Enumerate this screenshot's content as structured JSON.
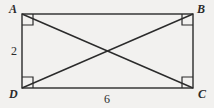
{
  "figure": {
    "kind": "rectangle-with-diagonals",
    "stroke_color": "#2b2b2b",
    "background_color": "#f2f1ef",
    "vertices": [
      {
        "id": "A",
        "label": "A",
        "position": "top-left",
        "x": 22,
        "y": 14,
        "right_angle": true
      },
      {
        "id": "B",
        "label": "B",
        "position": "top-right",
        "x": 193,
        "y": 14,
        "right_angle": true
      },
      {
        "id": "C",
        "label": "C",
        "position": "bottom-right",
        "x": 193,
        "y": 88,
        "right_angle": true
      },
      {
        "id": "D",
        "label": "D",
        "position": "bottom-left",
        "x": 22,
        "y": 88,
        "right_angle": true
      }
    ],
    "sides": [
      {
        "name": "AD",
        "orientation": "vertical",
        "label": "2"
      },
      {
        "name": "DC",
        "orientation": "horizontal",
        "label": "6"
      }
    ],
    "measurements": {
      "height_label": "2",
      "width_label": "6"
    },
    "diagonals": [
      {
        "name": "AC",
        "from": "A",
        "to": "C"
      },
      {
        "name": "BD",
        "from": "B",
        "to": "D"
      }
    ]
  }
}
